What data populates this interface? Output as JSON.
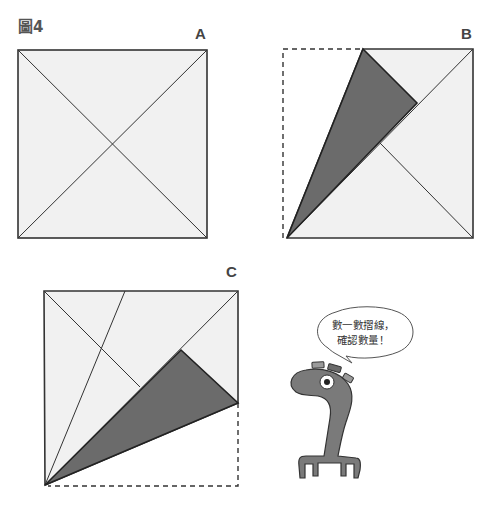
{
  "figure": {
    "title": "圖4",
    "panels": [
      {
        "label": "A",
        "description": "Square with both diagonals"
      },
      {
        "label": "B",
        "description": "Square with top-left corner folded along a crease toward the diagonal; dashed outline shows original corner"
      },
      {
        "label": "C",
        "description": "Square with bottom-right corner folded; dashed outline shows original corner"
      }
    ],
    "speech_bubble": {
      "line1": "數一數摺線，",
      "line2": "確認數量！"
    },
    "colors": {
      "paper": "#f1f1f1",
      "fold_shade": "#6b6b6b",
      "outline": "#333333",
      "creature": "#7a7a7a"
    }
  }
}
